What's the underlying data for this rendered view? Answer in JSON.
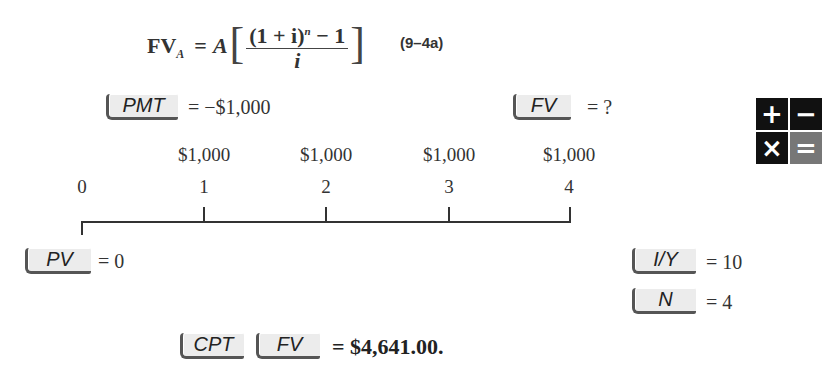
{
  "formula": {
    "lhs": "FV",
    "lhs_sub": "A",
    "equals": "=",
    "coef": "A",
    "numerator": "(1 + i)",
    "numerator_exp": "n",
    "numerator_tail": " − 1",
    "denominator": "i",
    "equation_number": "(9–4a)"
  },
  "inputs": {
    "pmt": {
      "key": "PMT",
      "value": "= −$1,000"
    },
    "fv": {
      "key": "FV",
      "value": "= ?"
    },
    "pv": {
      "key": "PV",
      "value": "= 0"
    },
    "iy": {
      "key": "I/Y",
      "value": "= 10"
    },
    "n": {
      "key": "N",
      "value": "= 4"
    }
  },
  "timeline": {
    "periods": [
      "0",
      "1",
      "2",
      "3",
      "4"
    ],
    "cash_flows": [
      "",
      "$1,000",
      "$1,000",
      "$1,000",
      "$1,000"
    ]
  },
  "operators_icon": {
    "plus": "+",
    "minus": "−",
    "times": "×",
    "equals": "="
  },
  "result": {
    "key1": "CPT",
    "key2": "FV",
    "value": "= $4,641.00."
  }
}
